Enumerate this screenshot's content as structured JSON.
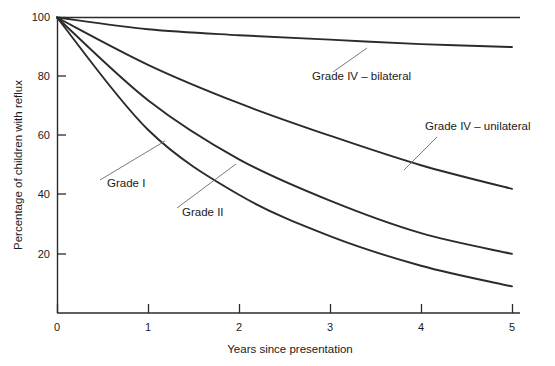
{
  "chart_data": {
    "type": "line",
    "title": "",
    "xlabel": "Years since presentation",
    "ylabel": "Percentage of children with reflux",
    "xlim": [
      0,
      5
    ],
    "ylim": [
      0,
      100
    ],
    "xticks": [
      "0",
      "1",
      "2",
      "3",
      "4",
      "5"
    ],
    "yticks": [
      "20",
      "40",
      "60",
      "80",
      "100"
    ],
    "grid": false,
    "legend_position": "inline-annotations",
    "x": [
      0,
      1,
      2,
      3,
      4,
      5
    ],
    "series": [
      {
        "name": "Grade IV – bilateral",
        "values": [
          100,
          96,
          94,
          92.5,
          91,
          90
        ]
      },
      {
        "name": "Grade IV – unilateral",
        "values": [
          100,
          84,
          71,
          60,
          50,
          42
        ]
      },
      {
        "name": "Grade II",
        "values": [
          100,
          72,
          52,
          38,
          27,
          20
        ]
      },
      {
        "name": "Grade I",
        "values": [
          100,
          62,
          40,
          26,
          16,
          9
        ]
      }
    ],
    "annotations": [
      {
        "id": "grade-1",
        "text": "Grade I",
        "label_x": 107,
        "label_y": 187,
        "leader_from_x": 100,
        "leader_from_y": 180,
        "leader_to_x": 165,
        "leader_to_y": 141
      },
      {
        "id": "grade-2",
        "text": "Grade II",
        "label_x": 182,
        "label_y": 216,
        "leader_from_x": 177,
        "leader_from_y": 208,
        "leader_to_x": 236,
        "leader_to_y": 164
      },
      {
        "id": "grade-4-bilateral",
        "text": "Grade IV – bilateral",
        "label_x": 312,
        "label_y": 80,
        "leader_from_x": 333,
        "leader_from_y": 72,
        "leader_to_x": 367,
        "leader_to_y": 48
      },
      {
        "id": "grade-4-unilateral",
        "text": "Grade IV – unilateral",
        "label_x": 425,
        "label_y": 130,
        "leader_from_x": 437,
        "leader_from_y": 137,
        "leader_to_x": 404,
        "leader_to_y": 170
      }
    ]
  },
  "axis": {
    "x_title": "Years since presentation",
    "y_title": "Percentage of children with reflux",
    "x_tick_labels": [
      "0",
      "1",
      "2",
      "3",
      "4",
      "5"
    ],
    "y_tick_labels": [
      "20",
      "40",
      "60",
      "80",
      "100"
    ]
  },
  "colors": {
    "curve": "#2b2b2b",
    "axis": "#2b2b2b",
    "leader": "#6b6b6b",
    "background": "#ffffff",
    "text": "#1a1a1a"
  }
}
